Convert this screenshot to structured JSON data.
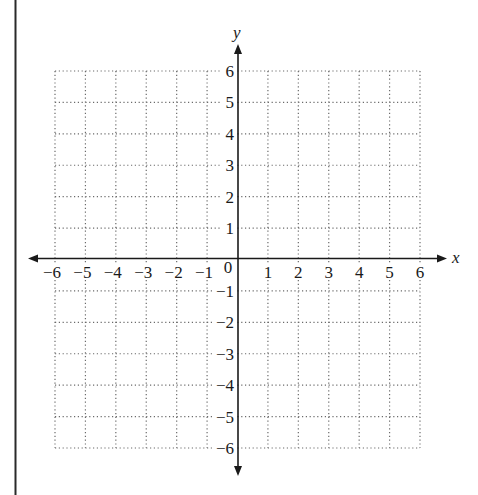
{
  "chart_data": {
    "type": "scatter",
    "title": "",
    "xlabel": "x",
    "ylabel": "y",
    "xlim": [
      -6,
      6
    ],
    "ylim": [
      -6,
      6
    ],
    "grid": true,
    "grid_style": "dotted",
    "x_ticks": [
      "-6",
      "-5",
      "-4",
      "-3",
      "-2",
      "-1",
      "0",
      "1",
      "2",
      "3",
      "4",
      "5",
      "6"
    ],
    "y_ticks": [
      "-6",
      "-5",
      "-4",
      "-3",
      "-2",
      "-1",
      "1",
      "2",
      "3",
      "4",
      "5",
      "6"
    ],
    "origin_label": "0",
    "series": [],
    "legend": null
  },
  "labels": {
    "x_axis": "x",
    "y_axis": "y",
    "origin": "0"
  },
  "colors": {
    "axis": "#1a1a1a",
    "grid": "#6b6b6b",
    "border": "#2a2a2a"
  }
}
